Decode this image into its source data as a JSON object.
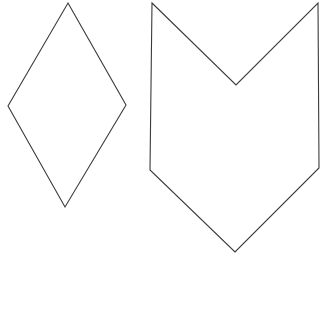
{
  "canvas": {
    "width": 325,
    "height": 310,
    "background_color": "#ffffff",
    "name": "geometric-shapes-figure"
  },
  "style": {
    "stroke_color": "#3a3a3a",
    "stroke_width": 1.1,
    "fill_color": "none"
  },
  "shapes": [
    {
      "id": "rhombus",
      "label": "Rhombus",
      "sides": 4,
      "points": "68,3 126,105 65,207 8,106",
      "vertices": [
        {
          "name": "top",
          "x": 68,
          "y": 3
        },
        {
          "name": "right",
          "x": 126,
          "y": 105
        },
        {
          "name": "bottom",
          "x": 65,
          "y": 207
        },
        {
          "name": "left",
          "x": 8,
          "y": 106
        }
      ],
      "bounds": {
        "x": 8,
        "y": 3,
        "width": 118,
        "height": 204
      }
    },
    {
      "id": "chevron-pennant",
      "label": "Concave hexagon",
      "sides": 6,
      "points": "152,3 236,85 318,3 319,168 235,252 150,170",
      "vertices": [
        {
          "name": "top-left",
          "x": 152,
          "y": 3
        },
        {
          "name": "notch-bottom",
          "x": 236,
          "y": 85
        },
        {
          "name": "top-right",
          "x": 318,
          "y": 3
        },
        {
          "name": "right-bend",
          "x": 319,
          "y": 168
        },
        {
          "name": "bottom-point",
          "x": 235,
          "y": 252
        },
        {
          "name": "left-bend",
          "x": 150,
          "y": 170
        }
      ],
      "bounds": {
        "x": 150,
        "y": 3,
        "width": 169,
        "height": 249
      }
    }
  ]
}
